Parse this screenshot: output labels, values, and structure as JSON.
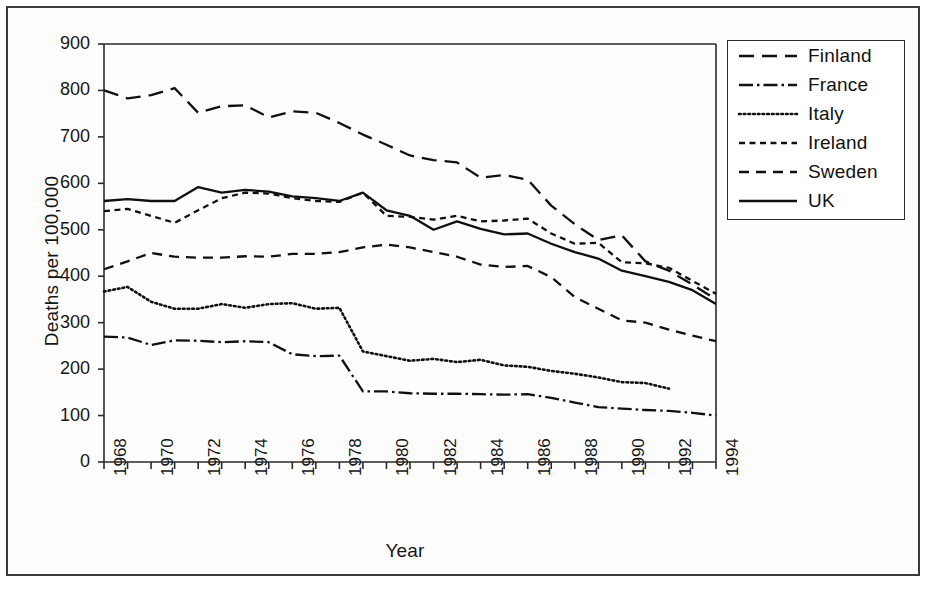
{
  "chart_data": {
    "type": "line",
    "title": "",
    "xlabel": "Year",
    "ylabel": "Deaths per 100,000",
    "xlim": [
      1968,
      1994
    ],
    "ylim": [
      0,
      900
    ],
    "ytick_labels": [
      "0",
      "100",
      "200",
      "300",
      "400",
      "500",
      "600",
      "700",
      "800",
      "900"
    ],
    "ytick_values": [
      0,
      100,
      200,
      300,
      400,
      500,
      600,
      700,
      800,
      900
    ],
    "xtick_labels": [
      "1968",
      "1970",
      "1972",
      "1974",
      "1976",
      "1978",
      "1980",
      "1982",
      "1984",
      "1986",
      "1988",
      "1990",
      "1992",
      "1994"
    ],
    "xtick_values": [
      1968,
      1970,
      1972,
      1974,
      1976,
      1978,
      1980,
      1982,
      1984,
      1986,
      1988,
      1990,
      1992,
      1994
    ],
    "minor_xticks": [
      1969,
      1971,
      1973,
      1975,
      1977,
      1979,
      1981,
      1983,
      1985,
      1987,
      1989,
      1991,
      1993
    ],
    "grid": false,
    "legend_position": "right",
    "x": [
      1968,
      1969,
      1970,
      1971,
      1972,
      1973,
      1974,
      1975,
      1976,
      1977,
      1978,
      1979,
      1980,
      1981,
      1982,
      1983,
      1984,
      1985,
      1986,
      1987,
      1988,
      1989,
      1990,
      1991,
      1992,
      1993,
      1994
    ],
    "series": [
      {
        "name": "Finland",
        "style": "long-dash",
        "color": "#101010",
        "values": [
          800,
          783,
          790,
          805,
          752,
          766,
          768,
          742,
          755,
          752,
          730,
          705,
          683,
          660,
          650,
          645,
          612,
          618,
          608,
          552,
          512,
          478,
          488,
          432,
          412,
          382,
          350
        ]
      },
      {
        "name": "France",
        "style": "dash-dot",
        "color": "#101010",
        "values": [
          270,
          268,
          252,
          262,
          261,
          258,
          260,
          258,
          232,
          228,
          229,
          152,
          152,
          148,
          147,
          147,
          146,
          145,
          146,
          138,
          128,
          118,
          115,
          112,
          110,
          106,
          100
        ]
      },
      {
        "name": "Italy",
        "style": "dotted",
        "color": "#101010",
        "values": [
          367,
          377,
          345,
          330,
          330,
          340,
          332,
          340,
          342,
          330,
          332,
          238,
          228,
          218,
          222,
          215,
          220,
          208,
          205,
          196,
          190,
          182,
          172,
          170,
          158,
          null,
          null
        ]
      },
      {
        "name": "Ireland",
        "style": "short-dash",
        "color": "#101010",
        "values": [
          540,
          545,
          530,
          515,
          542,
          568,
          580,
          578,
          568,
          562,
          560,
          580,
          530,
          528,
          522,
          530,
          518,
          520,
          524,
          492,
          470,
          472,
          430,
          428,
          418,
          390,
          362
        ]
      },
      {
        "name": "Sweden",
        "style": "medium-dash",
        "color": "#101010",
        "values": [
          415,
          432,
          450,
          442,
          440,
          440,
          443,
          442,
          448,
          448,
          452,
          462,
          468,
          462,
          452,
          442,
          425,
          420,
          422,
          398,
          355,
          330,
          305,
          300,
          285,
          272,
          260
        ]
      },
      {
        "name": "UK",
        "style": "solid",
        "color": "#101010",
        "values": [
          562,
          566,
          562,
          562,
          592,
          580,
          586,
          582,
          572,
          568,
          562,
          580,
          542,
          530,
          500,
          518,
          502,
          490,
          492,
          470,
          452,
          438,
          412,
          400,
          388,
          370,
          340
        ]
      }
    ]
  },
  "legend": {
    "items": [
      {
        "label": "Finland"
      },
      {
        "label": "France"
      },
      {
        "label": "Italy"
      },
      {
        "label": "Ireland"
      },
      {
        "label": "Sweden"
      },
      {
        "label": "UK"
      }
    ]
  }
}
